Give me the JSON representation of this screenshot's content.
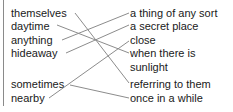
{
  "left_words": [
    {
      "id": "themselves",
      "label": "themselves",
      "y": 13
    },
    {
      "id": "daytime",
      "label": "daytime",
      "y": 25
    },
    {
      "id": "anything",
      "label": "anything",
      "y": 38
    },
    {
      "id": "hideaway",
      "label": "hideaway",
      "y": 51
    },
    {
      "id": "sometimes",
      "label": "sometimes",
      "y": 83
    },
    {
      "id": "nearby",
      "label": "nearby",
      "y": 97
    }
  ],
  "right_definitions": [
    {
      "id": "thing",
      "label": "a thing of any sort",
      "y": 13
    },
    {
      "id": "secret",
      "label": "a secret place",
      "y": 25
    },
    {
      "id": "close",
      "label": "close",
      "y": 38
    },
    {
      "id": "sunlight",
      "label": "when there is",
      "label2": "sunlight",
      "y": 51
    },
    {
      "id": "referring",
      "label": "referring to them",
      "y": 83
    },
    {
      "id": "once",
      "label": "once in a while",
      "y": 97
    }
  ],
  "matches": [
    {
      "from": "themselves",
      "to": "referring to them"
    },
    {
      "from": "daytime",
      "to": "when there is sunlight"
    },
    {
      "from": "anything",
      "to": "a thing of any sort"
    },
    {
      "from": "hideaway",
      "to": "a secret place"
    },
    {
      "from": "sometimes",
      "to": "once in a while"
    },
    {
      "from": "nearby",
      "to": "close"
    }
  ],
  "colors": {
    "line": "#8c8c8c",
    "text": "#1a1a1a",
    "border": "#8a8a8a"
  }
}
